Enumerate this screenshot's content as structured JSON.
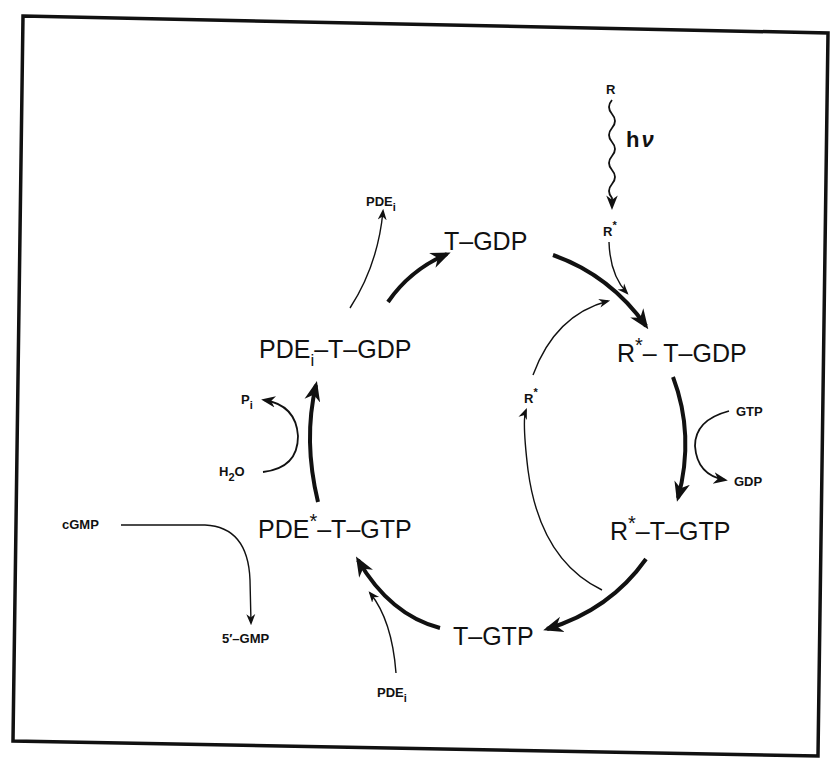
{
  "diagram": {
    "title": "",
    "colors": {
      "ink": "#111111",
      "background": "#ffffff"
    },
    "cycle_nodes": [
      {
        "id": "t_gdp",
        "label": "T–GDP"
      },
      {
        "id": "r_star_t_gdp",
        "base": "R",
        "sup": "*",
        "rest": "– T–GDP"
      },
      {
        "id": "r_star_t_gtp",
        "base": "R",
        "sup": "*",
        "rest": "–T–GTP"
      },
      {
        "id": "t_gtp",
        "label": "T–GTP"
      },
      {
        "id": "pde_star_t_gtp",
        "base": "PDE",
        "sup": "*",
        "rest": "–T–GTP"
      },
      {
        "id": "pde_i_t_gdp",
        "base": "PDE",
        "sub": "i",
        "rest": "–T–GDP"
      }
    ],
    "side_labels": {
      "r_top": "R",
      "hv_h": "h",
      "hv_nu": "ν",
      "r_star_top": {
        "base": "R",
        "sup": "*"
      },
      "r_star_recycle": {
        "base": "R",
        "sup": "*"
      },
      "gtp": "GTP",
      "gdp": "GDP",
      "pde_i_top": {
        "base": "PDE",
        "sub": "i"
      },
      "pde_i_bottom": {
        "base": "PDE",
        "sub": "i"
      },
      "p_i": {
        "base": "P",
        "sub": "i"
      },
      "h2o": {
        "base": "H",
        "sub": "2",
        "rest": "O"
      },
      "cgmp": "cGMP",
      "five_gmp": "5′–GMP"
    },
    "edges": [
      {
        "from": "R",
        "to": "R*",
        "style": "wavy",
        "label": "hν"
      },
      {
        "from": "R*",
        "to": "R*–T–GDP",
        "style": "thin"
      },
      {
        "from": "T–GDP",
        "to": "R*–T–GDP",
        "style": "thick"
      },
      {
        "from": "R*–T–GDP",
        "to": "R*–T–GTP",
        "style": "thick",
        "side": "GTP → GDP"
      },
      {
        "from": "R*–T–GTP",
        "to": "T–GTP",
        "style": "thick"
      },
      {
        "from": "R*–T–GTP",
        "to": "R*–T–GDP",
        "style": "thin",
        "via": "R*"
      },
      {
        "from": "T–GTP",
        "to": "PDE*–T–GTP",
        "style": "thick",
        "input": "PDE_i"
      },
      {
        "from": "cGMP",
        "to": "5′–GMP",
        "style": "thin"
      },
      {
        "from": "PDE*–T–GTP",
        "to": "PDE_i–T–GDP",
        "style": "thick",
        "side": "H2O → P_i"
      },
      {
        "from": "PDE_i–T–GDP",
        "to": "T–GDP",
        "style": "thick",
        "output": "PDE_i"
      }
    ]
  }
}
